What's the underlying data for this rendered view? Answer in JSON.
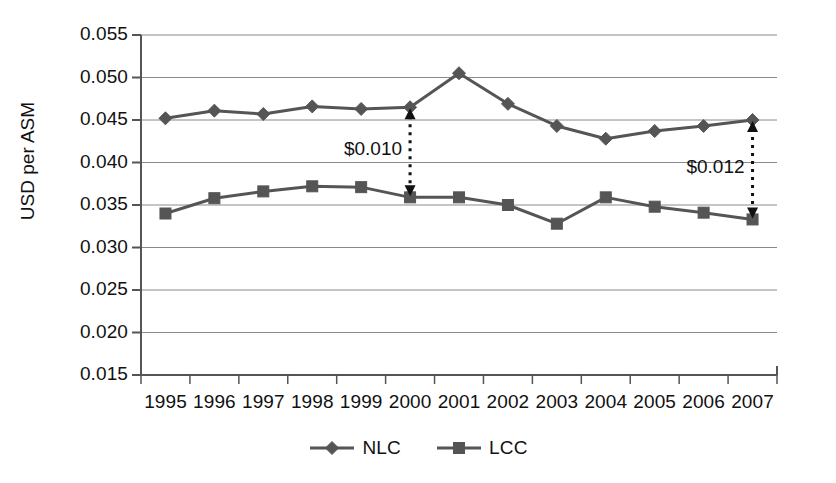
{
  "chart_data": {
    "type": "line",
    "title": "",
    "xlabel": "",
    "ylabel": "USD per ASM",
    "categories": [
      "1995",
      "1996",
      "1997",
      "1998",
      "1999",
      "2000",
      "2001",
      "2002",
      "2003",
      "2004",
      "2005",
      "2006",
      "2007"
    ],
    "ylim": [
      0.015,
      0.055
    ],
    "ytick_labels": [
      "0.055",
      "0.050",
      "0.045",
      "0.040",
      "0.035",
      "0.030",
      "0.025",
      "0.020",
      "0.015"
    ],
    "ytick_values": [
      0.055,
      0.05,
      0.045,
      0.04,
      0.035,
      0.03,
      0.025,
      0.02,
      0.015
    ],
    "grid": true,
    "legend_position": "bottom",
    "series": [
      {
        "name": "NLC",
        "marker": "diamond",
        "color": "#555555",
        "values": [
          0.0452,
          0.0461,
          0.0457,
          0.0466,
          0.0463,
          0.0465,
          0.0505,
          0.0469,
          0.0443,
          0.0428,
          0.0437,
          0.0443,
          0.045
        ]
      },
      {
        "name": "LCC",
        "marker": "square",
        "color": "#555555",
        "values": [
          0.034,
          0.0358,
          0.0366,
          0.0372,
          0.0371,
          0.0359,
          0.0359,
          0.035,
          0.0328,
          0.0359,
          0.0348,
          0.0341,
          0.0333
        ]
      }
    ],
    "annotations": [
      {
        "text": "$0.010",
        "category": "2000",
        "from_series": "NLC",
        "to_series": "LCC",
        "arrow": "double-headed-dotted",
        "label_side": "left"
      },
      {
        "text": "$0.012",
        "category": "2007",
        "from_series": "NLC",
        "to_series": "LCC",
        "arrow": "double-headed-dotted",
        "label_side": "left"
      }
    ]
  },
  "legend": {
    "items": [
      {
        "label": "NLC",
        "marker": "diamond"
      },
      {
        "label": "LCC",
        "marker": "square"
      }
    ]
  }
}
